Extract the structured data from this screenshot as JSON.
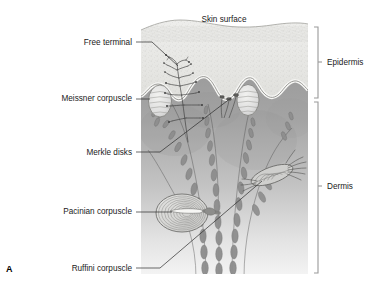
{
  "figure": {
    "panel_letter": "A",
    "title_label": "Skin surface"
  },
  "labels_left": [
    {
      "id": "free-terminal",
      "text": "Free terminal",
      "x": 132,
      "y": 45
    },
    {
      "id": "meissner-corpuscle",
      "text": "Meissner corpuscle",
      "x": 132,
      "y": 101
    },
    {
      "id": "merkle-disks",
      "text": "Merkle disks",
      "x": 132,
      "y": 155
    },
    {
      "id": "pacinian-corpuscle",
      "text": "Pacinian corpuscle",
      "x": 132,
      "y": 214
    },
    {
      "id": "ruffini-corpuscle",
      "text": "Ruffini corpuscle",
      "x": 132,
      "y": 271
    }
  ],
  "labels_right": [
    {
      "id": "epidermis",
      "text": "Epidermis",
      "x": 327,
      "y": 65
    },
    {
      "id": "dermis",
      "text": "Dermis",
      "x": 327,
      "y": 189
    }
  ],
  "structures": [
    {
      "id": "epidermis-layer",
      "name": "Epidermis"
    },
    {
      "id": "dermis-layer",
      "name": "Dermis"
    },
    {
      "id": "free-nerve-ending",
      "name": "Free terminal"
    },
    {
      "id": "meissner-left",
      "name": "Meissner corpuscle"
    },
    {
      "id": "meissner-right",
      "name": "Meissner corpuscle"
    },
    {
      "id": "merkle-disk-group",
      "name": "Merkle disks"
    },
    {
      "id": "pacinian-body",
      "name": "Pacinian corpuscle"
    },
    {
      "id": "ruffini-body",
      "name": "Ruffini corpuscle"
    },
    {
      "id": "nerve-bundle",
      "name": "Nerve fiber bundle"
    }
  ],
  "colors": {
    "background": "#ffffff",
    "epidermis_fill": "#e8e8e6",
    "epidermis_border": "#f4f4f2",
    "dermis_top": "#9a9a9a",
    "dermis_bottom": "#f2f2f2",
    "corpuscle_fill": "#dcdcda",
    "nerve_gray": "#7e7e7e",
    "leader_line": "#2b2b2b",
    "bracket_gray": "#9a9a9a",
    "text": "#1a1a1a"
  }
}
